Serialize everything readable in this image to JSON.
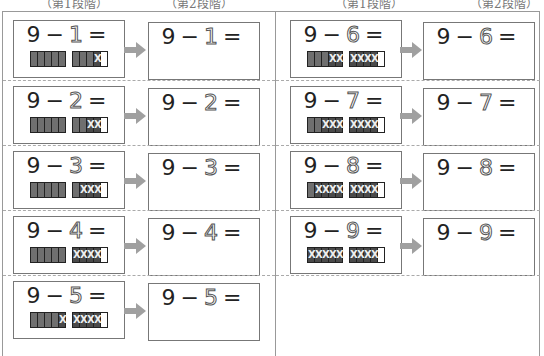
{
  "headers": [
    "（第1段階）",
    "（第2段階）",
    "（第1段階）",
    "（第2段階）"
  ],
  "colors": {
    "arrow": "#a0a0a0",
    "counter_fill": "#6f6f6f",
    "counter_crossed": "#4a4a4a",
    "border": "#777777"
  },
  "left_column": [
    {
      "minuend": "9",
      "operator": "−",
      "subtrahend": "1",
      "equals": "=",
      "crossed": 1
    },
    {
      "minuend": "9",
      "operator": "−",
      "subtrahend": "2",
      "equals": "=",
      "crossed": 2
    },
    {
      "minuend": "9",
      "operator": "−",
      "subtrahend": "3",
      "equals": "=",
      "crossed": 3
    },
    {
      "minuend": "9",
      "operator": "−",
      "subtrahend": "4",
      "equals": "=",
      "crossed": 4
    },
    {
      "minuend": "9",
      "operator": "−",
      "subtrahend": "5",
      "equals": "=",
      "crossed": 5
    }
  ],
  "right_column": [
    {
      "minuend": "9",
      "operator": "−",
      "subtrahend": "6",
      "equals": "=",
      "crossed": 6
    },
    {
      "minuend": "9",
      "operator": "−",
      "subtrahend": "7",
      "equals": "=",
      "crossed": 7
    },
    {
      "minuend": "9",
      "operator": "−",
      "subtrahend": "8",
      "equals": "=",
      "crossed": 8
    },
    {
      "minuend": "9",
      "operator": "−",
      "subtrahend": "9",
      "equals": "=",
      "crossed": 9
    }
  ],
  "counters": {
    "group_sizes": [
      5,
      5
    ],
    "total_filled": 9
  }
}
